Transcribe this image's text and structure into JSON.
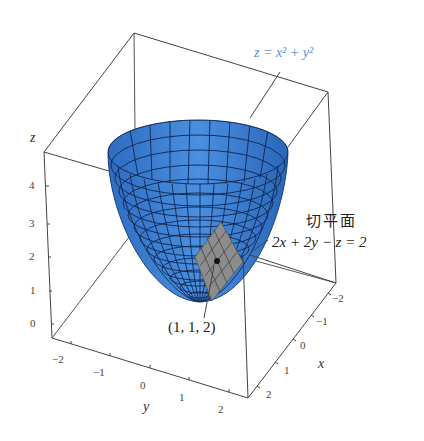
{
  "figure": {
    "surface_equation": "z = x² + y²",
    "tangent_plane_title": "切平面",
    "tangent_plane_equation": "2x + 2y − z = 2",
    "point_label": "(1, 1, 2)",
    "colors": {
      "surface": "#3b7fd6",
      "surface_dark": "#1f4f9a",
      "plane": "#8a8a8a",
      "box": "#444444",
      "surface_label": "#5b8fd0"
    }
  },
  "axes": {
    "z": {
      "label": "z",
      "ticks": [
        "0",
        "1",
        "2",
        "3",
        "4"
      ]
    },
    "y": {
      "label": "y",
      "ticks": [
        "−2",
        "−1",
        "0",
        "1",
        "2"
      ]
    },
    "x": {
      "label": "x",
      "ticks": [
        "−2",
        "−1",
        "0",
        "1",
        "2"
      ]
    }
  }
}
